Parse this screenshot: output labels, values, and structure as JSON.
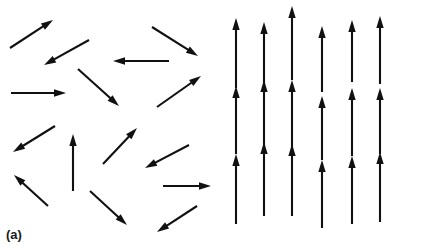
{
  "figure": {
    "width": 424,
    "height": 251,
    "background_color": "#ffffff",
    "arrow_color": "#111111"
  },
  "panels": [
    {
      "id": "a",
      "label": "(a)",
      "description": "disordered random spin orientations",
      "arrow_count": 16
    },
    {
      "id": "b",
      "label": "(b)",
      "description": "ordered aligned vertical spins",
      "arrow_count": 18,
      "columns": 6,
      "rows": 3
    }
  ],
  "chart_data": {
    "type": "scatter",
    "title": "",
    "xlabel": "",
    "ylabel": "",
    "panel_a": {
      "label": "(a)",
      "arrows": [
        {
          "x1": 10,
          "y1": 48,
          "x2": 53,
          "y2": 20,
          "angle_deg": 33
        },
        {
          "x1": 89,
          "y1": 40,
          "x2": 44,
          "y2": 65,
          "angle_deg": 209
        },
        {
          "x1": 152,
          "y1": 27,
          "x2": 198,
          "y2": 56,
          "angle_deg": -32
        },
        {
          "x1": 169,
          "y1": 61,
          "x2": 113,
          "y2": 61,
          "angle_deg": 180
        },
        {
          "x1": 11,
          "y1": 93,
          "x2": 66,
          "y2": 93,
          "angle_deg": 0
        },
        {
          "x1": 78,
          "y1": 69,
          "x2": 119,
          "y2": 106,
          "angle_deg": -42
        },
        {
          "x1": 157,
          "y1": 107,
          "x2": 201,
          "y2": 76,
          "angle_deg": 35
        },
        {
          "x1": 55,
          "y1": 126,
          "x2": 13,
          "y2": 152,
          "angle_deg": 212
        },
        {
          "x1": 73,
          "y1": 191,
          "x2": 73,
          "y2": 134,
          "angle_deg": 90
        },
        {
          "x1": 103,
          "y1": 164,
          "x2": 137,
          "y2": 128,
          "angle_deg": 46
        },
        {
          "x1": 189,
          "y1": 145,
          "x2": 145,
          "y2": 168,
          "angle_deg": 208
        },
        {
          "x1": 48,
          "y1": 206,
          "x2": 14,
          "y2": 175,
          "angle_deg": 137
        },
        {
          "x1": 163,
          "y1": 186,
          "x2": 211,
          "y2": 186,
          "angle_deg": 0
        },
        {
          "x1": 90,
          "y1": 191,
          "x2": 127,
          "y2": 225,
          "angle_deg": -42
        },
        {
          "x1": 197,
          "y1": 206,
          "x2": 157,
          "y2": 232,
          "angle_deg": 213
        },
        {
          "x1": 14,
          "y1": 126,
          "x2": 14,
          "y2": 126,
          "angle_deg": 0
        }
      ]
    },
    "panel_b": {
      "label": "(b)",
      "grid_columns": 6,
      "grid_rows": 3,
      "column_x": [
        24,
        52,
        80,
        110,
        140,
        168
      ],
      "row_baseline_y": [
        88,
        152,
        222
      ],
      "arrow_length": 70,
      "all_angle_deg": 90
    }
  }
}
